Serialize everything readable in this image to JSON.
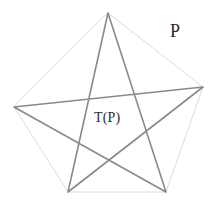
{
  "figure": {
    "type": "geometric-diagram",
    "canvas": {
      "width": 217,
      "height": 202,
      "background": "#ffffff"
    },
    "labels": [
      {
        "id": "p",
        "text": "P",
        "x": 170,
        "y": 22,
        "font_size": 18
      },
      {
        "id": "tp",
        "text": "T(P)",
        "x": 94,
        "y": 111,
        "font_size": 14
      }
    ],
    "shapes": {
      "pentagon": {
        "name": "P",
        "stroke": "#dcdcdc",
        "stroke_width": 1,
        "fill": "none",
        "vertices": [
          {
            "name": "top",
            "x": 108,
            "y": 13
          },
          {
            "name": "right",
            "x": 203,
            "y": 87
          },
          {
            "name": "bottom-right",
            "x": 166,
            "y": 192
          },
          {
            "name": "bottom-left",
            "x": 68,
            "y": 192
          },
          {
            "name": "left",
            "x": 14,
            "y": 107
          }
        ]
      },
      "pentagram": {
        "name": "T(P)",
        "stroke": "#8a8a8a",
        "stroke_width": 1.6,
        "fill": "none",
        "vertex_order": [
          "top",
          "bottom-right",
          "left",
          "right",
          "bottom-left"
        ],
        "vertices": [
          {
            "name": "top",
            "x": 108,
            "y": 13
          },
          {
            "name": "bottom-right",
            "x": 166,
            "y": 192
          },
          {
            "name": "left",
            "x": 14,
            "y": 107
          },
          {
            "name": "right",
            "x": 203,
            "y": 87
          },
          {
            "name": "bottom-left",
            "x": 68,
            "y": 192
          }
        ]
      }
    }
  }
}
